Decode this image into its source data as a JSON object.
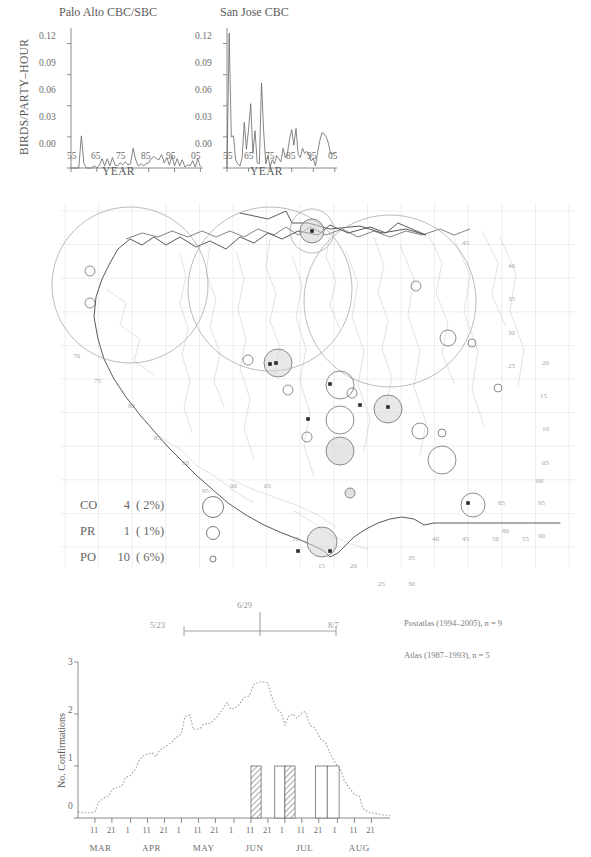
{
  "cbc_panel": {
    "y_axis_label": "BIRDS/PARTY–HOUR",
    "x_axis_label": "YEAR",
    "charts": [
      {
        "title": "Palo Alto CBC/SBC",
        "xlabel": "YEAR",
        "ylabel": "BIRDS/PARTY–HOUR",
        "yticks": [
          "0.12",
          "0.09",
          "0.06",
          "0.03",
          "0.00"
        ],
        "xticks": [
          "55",
          "65",
          "75",
          "85",
          "95",
          "05"
        ]
      },
      {
        "title": "San Jose CBC",
        "xlabel": "YEAR",
        "yticks": [
          "0.12",
          "0.09",
          "0.06",
          "0.03",
          "0.00"
        ],
        "xticks": [
          "55",
          "65",
          "75",
          "85",
          "95",
          "05"
        ]
      }
    ]
  },
  "chart_data": [
    {
      "type": "line",
      "title": "Palo Alto CBC/SBC",
      "xlabel": "YEAR",
      "ylabel": "BIRDS/PARTY-HOUR",
      "ylim": [
        0,
        0.135
      ],
      "xlim": [
        1955,
        2006
      ],
      "yticks": [
        0,
        0.03,
        0.06,
        0.09,
        0.12
      ],
      "xticks": [
        55,
        65,
        75,
        85,
        95,
        5
      ],
      "grid": false,
      "x": [
        1955,
        1956,
        1957,
        1958,
        1959,
        1960,
        1961,
        1962,
        1963,
        1964,
        1965,
        1966,
        1967,
        1968,
        1969,
        1970,
        1971,
        1972,
        1973,
        1974,
        1975,
        1976,
        1977,
        1978,
        1979,
        1980,
        1981,
        1982,
        1983,
        1984,
        1985,
        1986,
        1987,
        1988,
        1989,
        1990,
        1991,
        1992,
        1993,
        1994,
        1995,
        1996,
        1997,
        1998,
        1999,
        2000,
        2001,
        2002,
        2003,
        2004,
        2005
      ],
      "values": [
        0,
        0,
        0,
        0,
        0.031,
        0.004,
        0,
        0,
        0,
        0.002,
        0,
        0.003,
        0.009,
        0.002,
        0.009,
        0.002,
        0.01,
        0.003,
        0.002,
        0.005,
        0.003,
        0.006,
        0.003,
        0.004,
        0.019,
        0.008,
        0.002,
        0.004,
        0.002,
        0.004,
        0.005,
        0.009,
        0.011,
        0.009,
        0.008,
        0.013,
        0.005,
        0.01,
        0.003,
        0.012,
        0.002,
        0.009,
        0.002,
        0.008,
        0.001,
        0.003,
        0.002,
        0.007,
        0.001,
        0.009,
        0.001
      ]
    },
    {
      "type": "line",
      "title": "San Jose CBC",
      "xlabel": "YEAR",
      "ylabel": "BIRDS/PARTY-HOUR",
      "ylim": [
        0,
        0.135
      ],
      "xlim": [
        1955,
        2006
      ],
      "yticks": [
        0,
        0.03,
        0.06,
        0.09,
        0.12
      ],
      "xticks": [
        55,
        65,
        75,
        85,
        95,
        5
      ],
      "grid": false,
      "x": [
        1955,
        1956,
        1957,
        1958,
        1959,
        1960,
        1961,
        1962,
        1963,
        1964,
        1965,
        1966,
        1967,
        1968,
        1969,
        1970,
        1971,
        1972,
        1973,
        1974,
        1975,
        1976,
        1977,
        1978,
        1979,
        1980,
        1981,
        1982,
        1983,
        1984,
        1985,
        1986,
        1987,
        1988,
        1989,
        1990,
        1991,
        1992,
        1993,
        1994,
        1995,
        1996,
        1997,
        1998,
        1999,
        2000,
        2001,
        2002,
        2003,
        2004,
        2005
      ],
      "values": [
        0.0,
        0.13,
        0.03,
        0.031,
        0.008,
        0.004,
        0.002,
        0.01,
        0.044,
        0.018,
        0.037,
        0.062,
        0.014,
        0.036,
        0.005,
        0.004,
        0.082,
        0.035,
        0.004,
        0.012,
        0.001,
        0.008,
        0.004,
        0.012,
        0.009,
        0.006,
        0.019,
        0.01,
        0.014,
        0.028,
        0.037,
        0.022,
        0.038,
        0.013,
        0.01,
        0.019,
        0.014,
        0.016,
        0.013,
        0.007,
        0.009,
        0.002,
        0.015,
        0.026,
        0.034,
        0.033,
        0.03,
        0.024,
        0.014,
        0.014,
        0.014
      ]
    },
    {
      "type": "bar",
      "title": "",
      "xlabel": "",
      "ylabel": "No. Confirmations",
      "ylim": [
        0,
        3
      ],
      "yticks": [
        0,
        1,
        2,
        3
      ],
      "grid": false,
      "months": [
        "MAR",
        "APR",
        "MAY",
        "JUN",
        "JUL",
        "AUG"
      ],
      "day_ticks": [
        "11",
        "21",
        "1",
        "11",
        "21",
        "1",
        "11",
        "21",
        "1",
        "11",
        "21",
        "1",
        "11",
        "21",
        "1",
        "11",
        "21"
      ],
      "bars": [
        {
          "start": "6/11",
          "end": "6/17",
          "value": 1,
          "fill": "hatched"
        },
        {
          "start": "6/25",
          "end": "7/1",
          "value": 1,
          "fill": "open"
        },
        {
          "start": "7/1",
          "end": "7/6",
          "value": 1,
          "fill": "hatched"
        },
        {
          "start": "7/19",
          "end": "7/26",
          "value": 1,
          "fill": "open"
        },
        {
          "start": "7/26",
          "end": "8/2",
          "value": 1,
          "fill": "open"
        }
      ],
      "dotted_curve_note": "Dotted line = relative breeding-season abundance curve, peak ~2.6 in mid JUN"
    }
  ],
  "map": {
    "grid_labels_right": [
      "45",
      "40",
      "35",
      "30",
      "25",
      "20",
      "15",
      "10",
      "05",
      "00",
      "95",
      "90"
    ],
    "grid_labels_left": [
      "70",
      "75",
      "80",
      "85",
      "90",
      "95"
    ],
    "grid_labels_bottom": [
      "00",
      "05",
      "10",
      "15",
      "20",
      "25",
      "30",
      "35",
      "40",
      "45",
      "50",
      "55",
      "80",
      "85"
    ],
    "markers_note": "Breeding-evidence block circles over Santa Clara County outline with CBC count circles"
  },
  "legend": {
    "rows": [
      {
        "code": "CO",
        "count": "4",
        "pct": "( 2%)",
        "symbol": "large-circle"
      },
      {
        "code": "PR",
        "count": "1",
        "pct": "( 1%)",
        "symbol": "medium-circle"
      },
      {
        "code": "PO",
        "count": "10",
        "pct": "( 6%)",
        "symbol": "small-circle"
      }
    ]
  },
  "date_bar": {
    "left_label": "5/23",
    "center_label": "6/29",
    "right_label": "8/7"
  },
  "notes": {
    "postatlas": "Postatlas (1994–2005), n = 9",
    "atlas": "Atlas (1987–1993), n = 5"
  },
  "phenology": {
    "ylabel": "No. Confirmations",
    "yticks": [
      "3",
      "2",
      "1",
      "0"
    ],
    "months": [
      "MAR",
      "APR",
      "MAY",
      "JUN",
      "JUL",
      "AUG"
    ],
    "day_ticks": [
      "11",
      "21",
      "1",
      "11",
      "21",
      "1",
      "11",
      "21",
      "1",
      "11",
      "21",
      "1",
      "11",
      "21",
      "1",
      "11",
      "21"
    ]
  },
  "colors": {
    "ink": "#4a4a4a",
    "light_ink": "#8c8c8c",
    "grid": "#d9d9d9",
    "water": "#bdbdbd",
    "outline": "#5a5a5a"
  }
}
